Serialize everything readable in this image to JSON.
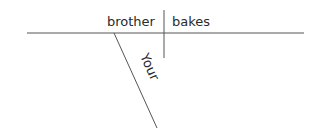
{
  "diagram": {
    "type": "sentence-diagram",
    "sentence": "Your brother bakes",
    "subject": "brother",
    "verb": "bakes",
    "modifiers": [
      {
        "word": "Your",
        "modifies": "brother"
      }
    ],
    "colors": {
      "line": "#555555",
      "text": "#2a2a2a",
      "background": "#ffffff"
    }
  }
}
